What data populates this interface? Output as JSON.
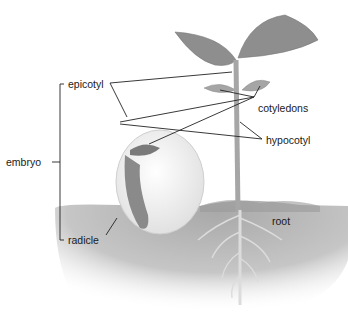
{
  "diagram": {
    "type": "labeled-illustration",
    "labels": {
      "embryo": "embryo",
      "epicotyl": "epicotyl",
      "radicle": "radicle",
      "cotyledons": "cotyledons",
      "hypocotyl": "hypocotyl",
      "root": "root"
    },
    "colors": {
      "soil": "#b4b4b4",
      "leaf": "#8c8c8c",
      "stem": "#a6a6a6",
      "seed": "#f2f2f2",
      "line": "#222222"
    }
  }
}
